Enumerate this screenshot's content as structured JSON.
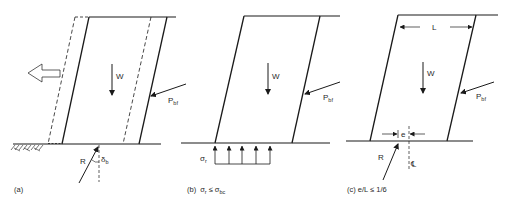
{
  "figure": {
    "stroke_color": "#1a1a1a",
    "background": "#ffffff",
    "panels": [
      {
        "id": "a",
        "caption": "(a)",
        "weight_label": "W",
        "earth_pressure_label": "P",
        "earth_pressure_sub": "bf",
        "reaction_label": "R",
        "angle_label": "δ",
        "angle_sub": "b",
        "notes": "Sliding: dashed outline shows displaced block, hollow arrow indicates sliding direction"
      },
      {
        "id": "b",
        "caption_prefix": "(b)",
        "caption_condition": "σ",
        "caption_sub1": "r",
        "caption_op": "≤",
        "caption_rhs": "σ",
        "caption_sub2": "bc",
        "weight_label": "W",
        "earth_pressure_label": "P",
        "earth_pressure_sub": "bf",
        "stress_label": "σ",
        "stress_sub": "r",
        "bearing_arrows": 5
      },
      {
        "id": "c",
        "caption": "(c)  e/L ≤ 1/6",
        "weight_label": "W",
        "earth_pressure_label": "P",
        "earth_pressure_sub": "bf",
        "reaction_label": "R",
        "length_label": "L",
        "eccentricity_label": "e",
        "centerline_label": "℄"
      }
    ]
  }
}
